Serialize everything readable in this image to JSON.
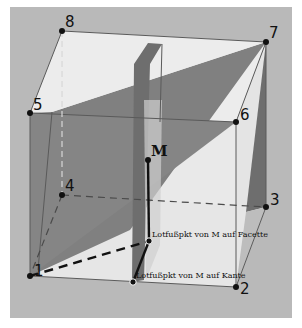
{
  "colors": {
    "page_background": "#ffffff",
    "canvas_background": "#b8b8b8",
    "face_light": "#ececec",
    "face_light_alt": "#e2e2e2",
    "plane_dark": "#7c7c7c",
    "plane_mid": "#969696",
    "edge": "#5a5a5a",
    "point": "#111111"
  },
  "vertices": [
    {
      "id": "1",
      "label": "1",
      "x": 30,
      "y": 276
    },
    {
      "id": "2",
      "label": "2",
      "x": 236,
      "y": 287
    },
    {
      "id": "3",
      "label": "3",
      "x": 266,
      "y": 207
    },
    {
      "id": "4",
      "label": "4",
      "x": 62,
      "y": 195
    },
    {
      "id": "5",
      "label": "5",
      "x": 30,
      "y": 113
    },
    {
      "id": "6",
      "label": "6",
      "x": 236,
      "y": 122
    },
    {
      "id": "7",
      "label": "7",
      "x": 266,
      "y": 42
    },
    {
      "id": "8",
      "label": "8",
      "x": 62,
      "y": 31
    }
  ],
  "points": {
    "M": {
      "label": "M",
      "x": 148,
      "y": 160
    },
    "foot_facet": {
      "label": "Lotfußpkt von M auf Facette",
      "x": 149,
      "y": 241
    },
    "foot_edge": {
      "label": "Lotfußpkt von M auf Kante",
      "x": 133,
      "y": 282
    }
  }
}
